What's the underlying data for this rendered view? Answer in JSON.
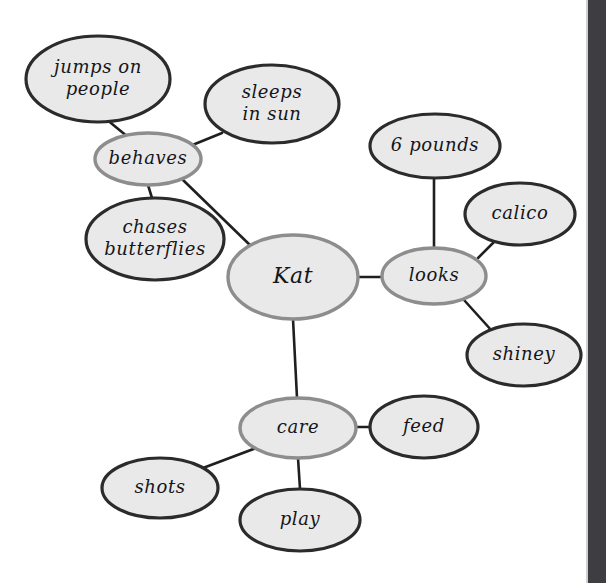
{
  "diagram": {
    "canvas": {
      "width": 606,
      "height": 583,
      "background": "#ffffff"
    },
    "colors": {
      "node_fill": "#e9e9e9",
      "primary_border": "#2b2b2b",
      "category_border": "#8d8d8d",
      "edge": "#1f1f1f",
      "text": "#15151a",
      "side_strip": "#3d3d42"
    },
    "center_label": "Kat",
    "nodes": [
      {
        "id": "kat",
        "label": "Kat",
        "lines": [
          "Kat"
        ],
        "cx": 293,
        "cy": 277,
        "rx": 65,
        "ry": 42,
        "style": "category",
        "font_size": 22
      },
      {
        "id": "behaves",
        "label": "behaves",
        "lines": [
          "behaves"
        ],
        "cx": 148,
        "cy": 159,
        "rx": 53,
        "ry": 26,
        "style": "category",
        "font_size": 18
      },
      {
        "id": "looks",
        "label": "looks",
        "lines": [
          "looks"
        ],
        "cx": 434,
        "cy": 276,
        "rx": 52,
        "ry": 28,
        "style": "category",
        "font_size": 18
      },
      {
        "id": "care",
        "label": "care",
        "lines": [
          "care"
        ],
        "cx": 298,
        "cy": 428,
        "rx": 58,
        "ry": 30,
        "style": "category",
        "font_size": 18
      },
      {
        "id": "jumps",
        "label": "jumps on people",
        "lines": [
          "jumps on",
          "people"
        ],
        "cx": 98,
        "cy": 79,
        "rx": 72,
        "ry": 43,
        "style": "primary",
        "font_size": 18
      },
      {
        "id": "sleeps",
        "label": "sleeps in sun",
        "lines": [
          "sleeps",
          "in sun"
        ],
        "cx": 272,
        "cy": 104,
        "rx": 67,
        "ry": 39,
        "style": "primary",
        "font_size": 18
      },
      {
        "id": "chases",
        "label": "chases butterflies",
        "lines": [
          "chases",
          "butterflies"
        ],
        "cx": 155,
        "cy": 239,
        "rx": 69,
        "ry": 41,
        "style": "primary",
        "font_size": 18
      },
      {
        "id": "sixpounds",
        "label": "6 pounds",
        "lines": [
          "6 pounds"
        ],
        "cx": 435,
        "cy": 146,
        "rx": 65,
        "ry": 32,
        "style": "primary",
        "font_size": 18
      },
      {
        "id": "calico",
        "label": "calico",
        "lines": [
          "calico"
        ],
        "cx": 520,
        "cy": 214,
        "rx": 55,
        "ry": 31,
        "style": "primary",
        "font_size": 18
      },
      {
        "id": "shiney",
        "label": "shiney",
        "lines": [
          "shiney"
        ],
        "cx": 524,
        "cy": 355,
        "rx": 57,
        "ry": 31,
        "style": "primary",
        "font_size": 18
      },
      {
        "id": "feed",
        "label": "feed",
        "lines": [
          "feed"
        ],
        "cx": 424,
        "cy": 427,
        "rx": 54,
        "ry": 31,
        "style": "primary",
        "font_size": 18
      },
      {
        "id": "shots",
        "label": "shots",
        "lines": [
          "shots"
        ],
        "cx": 160,
        "cy": 488,
        "rx": 58,
        "ry": 30,
        "style": "primary",
        "font_size": 18
      },
      {
        "id": "play",
        "label": "play",
        "lines": [
          "play"
        ],
        "cx": 300,
        "cy": 520,
        "rx": 60,
        "ry": 31,
        "style": "primary",
        "font_size": 18
      }
    ],
    "edges": [
      {
        "from": "kat",
        "to": "behaves",
        "x1": 253,
        "y1": 248,
        "x2": 183,
        "y2": 180
      },
      {
        "from": "kat",
        "to": "looks",
        "x1": 358,
        "y1": 277,
        "x2": 382,
        "y2": 277
      },
      {
        "from": "kat",
        "to": "care",
        "x1": 293,
        "y1": 319,
        "x2": 297,
        "y2": 398
      },
      {
        "from": "behaves",
        "to": "jumps",
        "x1": 128,
        "y1": 137,
        "x2": 106,
        "y2": 119
      },
      {
        "from": "behaves",
        "to": "sleeps",
        "x1": 190,
        "y1": 146,
        "x2": 222,
        "y2": 133
      },
      {
        "from": "behaves",
        "to": "chases",
        "x1": 148,
        "y1": 185,
        "x2": 152,
        "y2": 198
      },
      {
        "from": "looks",
        "to": "sixpounds",
        "x1": 434,
        "y1": 248,
        "x2": 434,
        "y2": 178
      },
      {
        "from": "looks",
        "to": "calico",
        "x1": 478,
        "y1": 258,
        "x2": 496,
        "y2": 240
      },
      {
        "from": "looks",
        "to": "shiney",
        "x1": 464,
        "y1": 300,
        "x2": 492,
        "y2": 331
      },
      {
        "from": "care",
        "to": "feed",
        "x1": 356,
        "y1": 427,
        "x2": 370,
        "y2": 427
      },
      {
        "from": "care",
        "to": "shots",
        "x1": 256,
        "y1": 448,
        "x2": 203,
        "y2": 468
      },
      {
        "from": "care",
        "to": "play",
        "x1": 298,
        "y1": 458,
        "x2": 300,
        "y2": 489
      }
    ],
    "side_strip": {
      "name": "right-dark-strip",
      "width": 18,
      "color": "#3d3d42"
    }
  }
}
